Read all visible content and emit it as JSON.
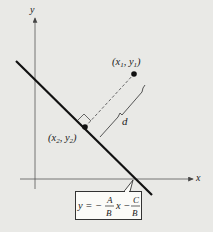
{
  "diagram": {
    "axes": {
      "x_label": "x",
      "y_label": "y"
    },
    "point1": {
      "label_open": "(x",
      "sub1": "1",
      "sep": ", y",
      "sub2": "1",
      "label_close": ")"
    },
    "point2": {
      "label_open": "(x",
      "sub1": "2",
      "sep": ", y",
      "sub2": "2",
      "label_close": ")"
    },
    "distance_label": "d",
    "line_equation": {
      "lhs": "y = −",
      "frac1_num": "A",
      "frac1_den": "B",
      "mid": "x −",
      "frac2_num": "C",
      "frac2_den": "B"
    },
    "colors": {
      "background": "#e9e9e6",
      "line": "#111111",
      "dashed": "#666666",
      "box": "#fbfbf8"
    }
  }
}
